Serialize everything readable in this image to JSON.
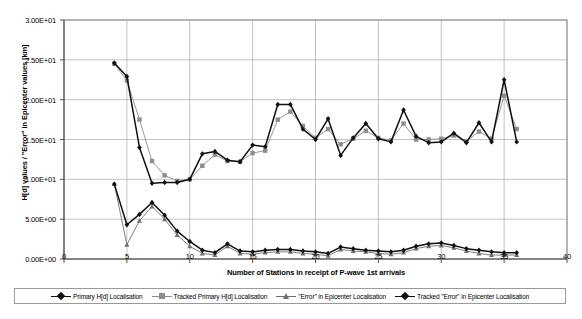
{
  "chart_data": {
    "type": "line",
    "title": "",
    "xlabel": "Number of Stations in receipt of P-wave 1st arrivals",
    "ylabel": "H[d] values / \"Error\" in Epicenter values [km]",
    "xlim": [
      0,
      40
    ],
    "ylim": [
      0,
      30
    ],
    "xticks": [
      "0",
      "5",
      "10",
      "15",
      "20",
      "25",
      "30",
      "35",
      "40"
    ],
    "xtick_values": [
      0,
      5,
      10,
      15,
      20,
      25,
      30,
      35,
      40
    ],
    "yticks": [
      "0.00E+00",
      "5.00E+00",
      "1.00E+01",
      "1.50E+01",
      "2.00E+01",
      "2.50E+01",
      "3.00E+01"
    ],
    "ytick_values": [
      0,
      5,
      10,
      15,
      20,
      25,
      30
    ],
    "grid": "horizontal-and-vertical",
    "legend_position": "below-plot",
    "x": [
      4,
      5,
      6,
      7,
      8,
      9,
      10,
      11,
      12,
      13,
      14,
      15,
      16,
      17,
      18,
      19,
      20,
      21,
      22,
      23,
      24,
      25,
      26,
      27,
      28,
      29,
      30,
      31,
      32,
      33,
      34,
      35,
      36
    ],
    "series": [
      {
        "name": "Primary H[d] Localisation",
        "color": "#111111",
        "marker": "diamond",
        "values": [
          24.6,
          22.9,
          14.0,
          9.5,
          9.6,
          9.6,
          10.0,
          13.2,
          13.5,
          12.4,
          12.2,
          14.3,
          14.1,
          19.4,
          19.4,
          16.3,
          15.0,
          17.6,
          13.0,
          15.2,
          17.0,
          15.1,
          14.7,
          18.7,
          15.4,
          14.6,
          14.7,
          15.8,
          14.6,
          17.1,
          14.7,
          22.5,
          14.7
        ]
      },
      {
        "name": "Tracked Primary H[d] Localisation",
        "color": "#8d8d8d",
        "marker": "square",
        "values": [
          24.5,
          22.4,
          17.5,
          12.3,
          10.5,
          9.8,
          10.0,
          11.7,
          13.1,
          12.3,
          12.2,
          13.3,
          13.6,
          17.5,
          18.5,
          16.7,
          15.2,
          16.3,
          14.4,
          15.1,
          16.1,
          15.2,
          14.9,
          17.0,
          15.0,
          15.0,
          15.1,
          15.5,
          14.8,
          16.0,
          15.1,
          20.5,
          16.3
        ]
      },
      {
        "name": "\"Error\" in Epicenter Localisation",
        "color": "#6f6f6f",
        "marker": "triangle",
        "values": [
          9.4,
          1.8,
          4.8,
          6.6,
          5.0,
          3.0,
          1.6,
          0.7,
          0.5,
          1.6,
          0.7,
          0.6,
          0.8,
          0.9,
          0.9,
          0.7,
          0.6,
          0.4,
          1.2,
          1.0,
          0.9,
          0.7,
          0.6,
          0.8,
          1.3,
          1.6,
          1.7,
          1.4,
          1.0,
          0.7,
          0.5,
          0.5,
          0.5
        ]
      },
      {
        "name": "Tracked \"Error\" in Epicenter Localisation",
        "color": "#111111",
        "marker": "diamond",
        "values": [
          9.4,
          4.3,
          5.6,
          7.1,
          5.5,
          3.5,
          2.2,
          1.1,
          0.8,
          1.9,
          1.0,
          0.9,
          1.1,
          1.2,
          1.2,
          1.0,
          0.9,
          0.7,
          1.5,
          1.3,
          1.1,
          1.0,
          0.9,
          1.1,
          1.6,
          1.9,
          2.0,
          1.7,
          1.3,
          1.1,
          0.9,
          0.8,
          0.8
        ]
      }
    ]
  }
}
